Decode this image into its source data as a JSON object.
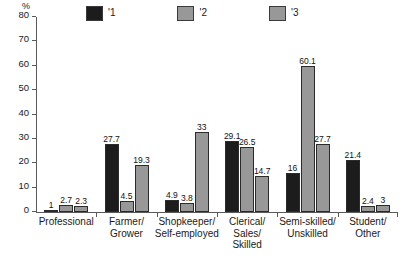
{
  "chart_data": {
    "type": "bar",
    "title": "",
    "subtitle": "",
    "xlabel": "",
    "ylabel": "%",
    "ylim": [
      0,
      80
    ],
    "yticks": [
      0,
      10,
      20,
      30,
      40,
      50,
      60,
      70,
      80
    ],
    "grid": false,
    "legend_position": "top",
    "categories": [
      "Professional",
      "Farmer/ Grower",
      "Shopkeeper/ Self-employed",
      "Clerical/ Sales/ Skilled",
      "Semi-skilled/ Unskilled",
      "Student/ Other"
    ],
    "category_lines": [
      [
        "Professional"
      ],
      [
        "Farmer/",
        "Grower"
      ],
      [
        "Shopkeeper/",
        "Self-employed"
      ],
      [
        "Clerical/",
        "Sales/",
        "Skilled"
      ],
      [
        "Semi-skilled/",
        "Unskilled"
      ],
      [
        "Student/",
        "Other"
      ]
    ],
    "series": [
      {
        "name": "'1",
        "color": "#1c1c1c",
        "values": [
          1,
          27.7,
          4.9,
          29.1,
          16,
          21.4
        ],
        "labels": [
          "1",
          "27.7",
          "4.9",
          "29.1",
          "16",
          "21.4"
        ]
      },
      {
        "name": "'2",
        "color": "#989898",
        "values": [
          2.7,
          4.5,
          3.8,
          26.5,
          60.1,
          2.4
        ],
        "labels": [
          "2.7",
          "4.5",
          "3.8",
          "26.5",
          "60.1",
          "2.4"
        ]
      },
      {
        "name": "'3",
        "color": "#989898",
        "values": [
          2.3,
          19.3,
          33,
          14.7,
          27.7,
          3
        ],
        "labels": [
          "2.3",
          "19.3",
          "33",
          "14.7",
          "27.7",
          "3"
        ]
      }
    ]
  },
  "legend": {
    "items": [
      {
        "label": "'1",
        "color": "#1c1c1c"
      },
      {
        "label": "'2",
        "color": "#989898"
      },
      {
        "label": "'3",
        "color": "#989898"
      }
    ]
  },
  "axis": {
    "unit_label": "%",
    "y_tick_labels": [
      "0",
      "10",
      "20",
      "30",
      "40",
      "50",
      "60",
      "70",
      "80"
    ]
  }
}
